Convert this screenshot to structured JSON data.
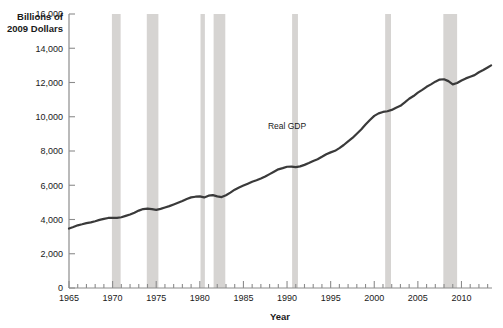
{
  "chart_data": {
    "type": "line",
    "title": "",
    "subtitle": "",
    "xlabel": "Year",
    "ylabel": "Billions of 2009 Dollars",
    "ylabel_line1": "Billions of",
    "ylabel_line2": "2009 Dollars",
    "xlim": [
      1965,
      2013.5
    ],
    "ylim": [
      0,
      16000
    ],
    "grid": false,
    "legend_position": "inline-annotation",
    "yticks": [
      0,
      2000,
      4000,
      6000,
      8000,
      10000,
      12000,
      14000,
      16000
    ],
    "ytick_labels": [
      "0",
      "2,000",
      "4,000",
      "6,000",
      "8,000",
      "10,000",
      "12,000",
      "14,000",
      "16,000"
    ],
    "xticks": [
      1965,
      1970,
      1975,
      1980,
      1985,
      1990,
      1995,
      2000,
      2005,
      2010
    ],
    "xtick_labels": [
      "1965",
      "1970",
      "1975",
      "1980",
      "1985",
      "1990",
      "1995",
      "2000",
      "2005",
      "2010"
    ],
    "minor_xtick_interval": 1,
    "annotations": [
      {
        "text": "Real GDP",
        "x": 1990.0,
        "y": 9300,
        "name": "real-gdp-label"
      }
    ],
    "shaded_bands": {
      "name": "recession-bands",
      "color": "#d6d4d2",
      "label": "Recessions",
      "ranges": [
        [
          1969.92,
          1970.92
        ],
        [
          1973.92,
          1975.25
        ],
        [
          1980.08,
          1980.58
        ],
        [
          1981.58,
          1982.92
        ],
        [
          1990.58,
          1991.25
        ],
        [
          2001.25,
          2001.92
        ],
        [
          2007.92,
          2009.5
        ]
      ]
    },
    "series": [
      {
        "name": "Real GDP",
        "color": "#3a3a3a",
        "x": [
          1965,
          1965.5,
          1966,
          1966.5,
          1967,
          1967.5,
          1968,
          1968.5,
          1969,
          1969.5,
          1970,
          1970.5,
          1971,
          1971.5,
          1972,
          1972.5,
          1973,
          1973.5,
          1974,
          1974.5,
          1975,
          1975.5,
          1976,
          1976.5,
          1977,
          1977.5,
          1978,
          1978.5,
          1979,
          1979.5,
          1980,
          1980.5,
          1981,
          1981.5,
          1982,
          1982.5,
          1983,
          1983.5,
          1984,
          1984.5,
          1985,
          1985.5,
          1986,
          1986.5,
          1987,
          1987.5,
          1988,
          1988.5,
          1989,
          1989.5,
          1990,
          1990.5,
          1991,
          1991.5,
          1992,
          1992.5,
          1993,
          1993.5,
          1994,
          1994.5,
          1995,
          1995.5,
          1996,
          1996.5,
          1997,
          1997.5,
          1998,
          1998.5,
          1999,
          1999.5,
          2000,
          2000.5,
          2001,
          2001.5,
          2002,
          2002.5,
          2003,
          2003.5,
          2004,
          2004.5,
          2005,
          2005.5,
          2006,
          2006.5,
          2007,
          2007.5,
          2008,
          2008.5,
          2009,
          2009.5,
          2010,
          2010.5,
          2011,
          2011.5,
          2012,
          2012.5,
          2013,
          2013.4
        ],
        "values": [
          3470,
          3560,
          3660,
          3720,
          3790,
          3830,
          3900,
          3980,
          4040,
          4090,
          4100,
          4090,
          4130,
          4210,
          4290,
          4400,
          4520,
          4610,
          4640,
          4610,
          4560,
          4620,
          4700,
          4780,
          4880,
          4980,
          5080,
          5200,
          5290,
          5330,
          5350,
          5290,
          5390,
          5420,
          5350,
          5310,
          5420,
          5570,
          5740,
          5870,
          5980,
          6090,
          6200,
          6290,
          6390,
          6510,
          6650,
          6790,
          6930,
          7000,
          7080,
          7090,
          7060,
          7100,
          7190,
          7300,
          7420,
          7520,
          7660,
          7810,
          7920,
          8010,
          8170,
          8350,
          8560,
          8760,
          9010,
          9260,
          9550,
          9810,
          10050,
          10200,
          10280,
          10320,
          10400,
          10530,
          10640,
          10840,
          11050,
          11210,
          11410,
          11570,
          11750,
          11890,
          12050,
          12170,
          12190,
          12080,
          11890,
          11970,
          12120,
          12240,
          12340,
          12430,
          12600,
          12730,
          12880,
          13000
        ],
        "units": "Billions of 2009 dollars",
        "first_value": 3470,
        "last_value": 13530,
        "peak_value": 13530
      }
    ]
  },
  "figure": {
    "background": "#ffffff",
    "axis_color": "#7a7a7a",
    "text_color": "#1a1a1a",
    "line_color": "#3a3a3a",
    "band_color": "#d6d4d2"
  }
}
